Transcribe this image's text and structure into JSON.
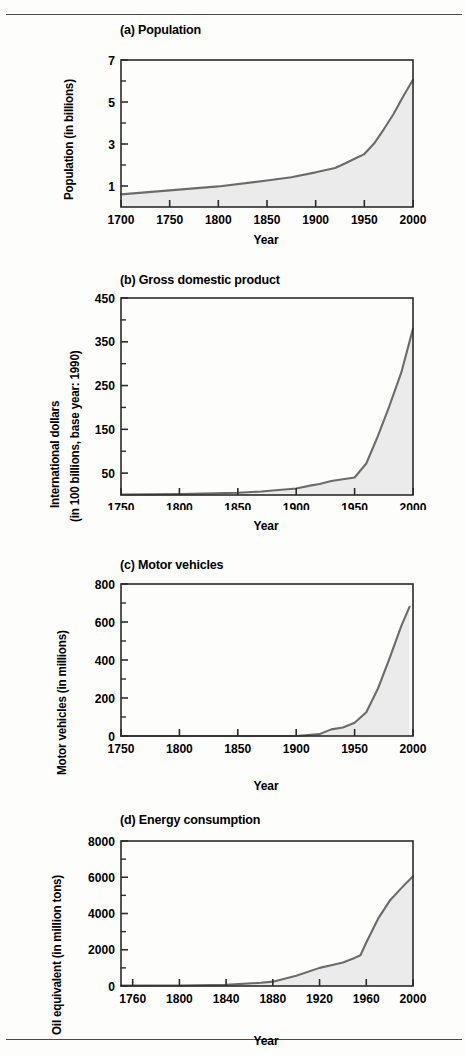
{
  "figure": {
    "background_color": "#fdfdfc",
    "rule_color": "#4a4a4a",
    "line_color": "#6b6b6b",
    "fill_color": "#ebebeb",
    "axis_color": "#2b2b2b",
    "shared_xlabel": "Year"
  },
  "panels": [
    {
      "key": "population",
      "title": "(a) Population",
      "ylabel_lines": [
        "Population (in billions)"
      ],
      "xlabel": "Year"
    },
    {
      "key": "gdp",
      "title": "(b) Gross domestic product",
      "ylabel_lines": [
        "International dollars",
        "(in 100 billions, base year: 1990)"
      ],
      "xlabel": "Year"
    },
    {
      "key": "motor_vehicles",
      "title": "(c) Motor vehicles",
      "ylabel_lines": [
        "Motor vehicles (in millions)"
      ],
      "xlabel": "Year"
    },
    {
      "key": "energy",
      "title": "(d) Energy consumption",
      "ylabel_lines": [
        "Oil equivalent (in million tons)"
      ],
      "xlabel": "Year"
    }
  ],
  "chart_data": [
    {
      "type": "area",
      "panel": "a",
      "title": "(a) Population",
      "xlabel": "Year",
      "ylabel": "Population (in billions)",
      "xlim": [
        1700,
        2000
      ],
      "ylim": [
        0,
        7
      ],
      "xticks": [
        1700,
        1750,
        1800,
        1850,
        1900,
        1950,
        2000
      ],
      "xtick_labels": [
        "1700",
        "1750",
        "1800",
        "1850",
        "1900",
        "1950",
        "2000"
      ],
      "yticks": [
        1,
        3,
        5,
        7
      ],
      "ytick_labels": [
        "1",
        "3",
        "5",
        "7"
      ],
      "yminor_ticks": [
        2,
        4,
        6
      ],
      "grid": false,
      "legend": null,
      "x": [
        1700,
        1750,
        1800,
        1850,
        1875,
        1900,
        1920,
        1930,
        1940,
        1950,
        1960,
        1970,
        1980,
        1990,
        2000
      ],
      "values": [
        0.6,
        0.79,
        0.98,
        1.26,
        1.42,
        1.65,
        1.86,
        2.07,
        2.3,
        2.52,
        3.02,
        3.7,
        4.43,
        5.27,
        6.06
      ]
    },
    {
      "type": "area",
      "panel": "b",
      "title": "(b) Gross domestic product",
      "xlabel": "Year",
      "ylabel": "International dollars (in 100 billions, base year: 1990)",
      "xlim": [
        1750,
        2000
      ],
      "ylim": [
        0,
        450
      ],
      "xticks": [
        1750,
        1800,
        1850,
        1900,
        1950,
        2000
      ],
      "xtick_labels": [
        "1750",
        "1800",
        "1850",
        "1900",
        "1950",
        "2000"
      ],
      "yticks": [
        50,
        150,
        250,
        350,
        450
      ],
      "ytick_labels": [
        "50",
        "150",
        "250",
        "350",
        "450"
      ],
      "yminor_ticks": [
        100,
        200,
        300,
        400
      ],
      "grid": false,
      "legend": null,
      "x": [
        1750,
        1800,
        1850,
        1870,
        1900,
        1913,
        1920,
        1930,
        1940,
        1950,
        1960,
        1970,
        1980,
        1990,
        2000
      ],
      "values": [
        1,
        2,
        5,
        8,
        15,
        22,
        25,
        32,
        36,
        40,
        72,
        135,
        205,
        280,
        380
      ]
    },
    {
      "type": "area",
      "panel": "c",
      "title": "(c) Motor vehicles",
      "xlabel": "Year",
      "ylabel": "Motor vehicles (in millions)",
      "xlim": [
        1750,
        2000
      ],
      "ylim": [
        0,
        800
      ],
      "xticks": [
        1750,
        1800,
        1850,
        1900,
        1950,
        2000
      ],
      "xtick_labels": [
        "1750",
        "1800",
        "1850",
        "1900",
        "1950",
        "2000"
      ],
      "yticks": [
        0,
        200,
        400,
        600,
        800
      ],
      "ytick_labels": [
        "0",
        "200",
        "400",
        "600",
        "800"
      ],
      "yminor_ticks": [
        100,
        300,
        500,
        700
      ],
      "grid": false,
      "legend": null,
      "x": [
        1750,
        1800,
        1850,
        1900,
        1920,
        1930,
        1940,
        1950,
        1960,
        1970,
        1980,
        1990,
        1997
      ],
      "values": [
        0,
        0,
        0,
        0,
        10,
        35,
        45,
        70,
        125,
        250,
        410,
        580,
        680
      ]
    },
    {
      "type": "area",
      "panel": "d",
      "title": "(d) Energy consumption",
      "xlabel": "Year",
      "ylabel": "Oil equivalent (in million tons)",
      "xlim": [
        1750,
        2000
      ],
      "ylim": [
        0,
        8000
      ],
      "xticks": [
        1760,
        1800,
        1840,
        1880,
        1920,
        1960,
        2000
      ],
      "xtick_labels": [
        "1760",
        "1800",
        "1840",
        "1880",
        "1920",
        "1960",
        "2000"
      ],
      "yticks": [
        0,
        2000,
        4000,
        6000,
        8000
      ],
      "ytick_labels": [
        "0",
        "2000",
        "4000",
        "6000",
        "8000"
      ],
      "yminor_ticks": [
        1000,
        3000,
        5000,
        7000
      ],
      "grid": false,
      "legend": null,
      "x": [
        1750,
        1800,
        1840,
        1870,
        1880,
        1900,
        1920,
        1930,
        1940,
        1950,
        1955,
        1960,
        1970,
        1980,
        1990,
        2000
      ],
      "values": [
        20,
        30,
        60,
        180,
        240,
        560,
        1000,
        1150,
        1300,
        1550,
        1700,
        2400,
        3700,
        4700,
        5400,
        6050
      ]
    }
  ]
}
